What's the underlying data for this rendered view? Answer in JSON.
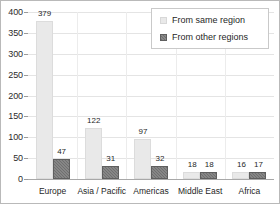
{
  "chart_data": {
    "type": "bar",
    "title": "",
    "subtitle": "",
    "xlabel": "",
    "ylabel": "",
    "categories": [
      "Europe",
      "Asia / Pacific",
      "Americas",
      "Middle East",
      "Africa"
    ],
    "series": [
      {
        "name": "From same region",
        "values": [
          379,
          122,
          97,
          18,
          16
        ],
        "color": "#e9e9e9"
      },
      {
        "name": "From other regions",
        "values": [
          47,
          31,
          32,
          18,
          17
        ],
        "color": "#6f6f6f"
      }
    ],
    "ylim": [
      0,
      400
    ],
    "yticks": [
      0,
      50,
      100,
      150,
      200,
      250,
      300,
      350,
      400
    ],
    "ytick_labels": [
      "0",
      "50",
      "100",
      "150",
      "200",
      "250",
      "300",
      "350",
      "400"
    ],
    "grid": true,
    "data_labels": true,
    "legend": {
      "position": "top-right",
      "entries": [
        "From same region",
        "From other regions"
      ]
    }
  },
  "colors": {
    "same_region": "#e9e9e9",
    "other_regions": "#6f6f6f",
    "gridline": "#e4e4e4",
    "axis": "#a8a8a8",
    "text": "#1f1f1f",
    "border": "#b9b9b9"
  }
}
